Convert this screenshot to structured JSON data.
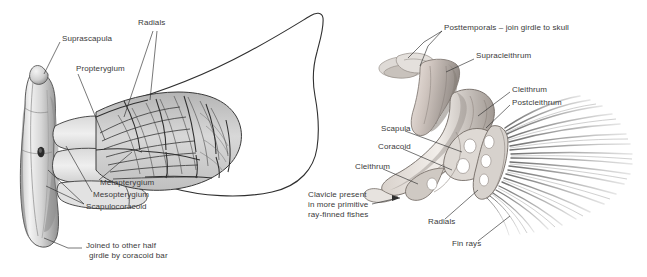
{
  "figure": {
    "background": "#ffffff",
    "ink": "#3a3a3a",
    "label_font_px": 8,
    "panels": [
      {
        "id": "left-panel",
        "name": "shark-pectoral-girdle-and-fin",
        "labels": [
          {
            "key": "suprascapula",
            "text": "Suprascapula",
            "x": 62,
            "y": 38
          },
          {
            "key": "radials_left",
            "text": "Radials",
            "x": 138,
            "y": 22
          },
          {
            "key": "propterygium",
            "text": "Propterygium",
            "x": 76,
            "y": 68
          },
          {
            "key": "metapterygium",
            "text": "Metapterygium",
            "x": 100,
            "y": 182
          },
          {
            "key": "mesopterygium",
            "text": "Mesopterygium",
            "x": 93,
            "y": 194
          },
          {
            "key": "scapulocoracoid",
            "text": "Scapulocoracoid",
            "x": 86,
            "y": 206
          },
          {
            "key": "joined_1",
            "text": "Joined to other half",
            "x": 86,
            "y": 245
          },
          {
            "key": "joined_2",
            "text": "girdle by coracoid bar",
            "x": 86,
            "y": 255
          }
        ]
      },
      {
        "id": "right-panel",
        "name": "bony-fish-pectoral-girdle-and-fin",
        "labels": [
          {
            "key": "posttemporals",
            "text": "Posttemporals – join girdle to skull",
            "x": 444,
            "y": 27
          },
          {
            "key": "supracleithrum",
            "text": "Supracleithrum",
            "x": 476,
            "y": 55
          },
          {
            "key": "cleithrum_top",
            "text": "Cleithrum",
            "x": 512,
            "y": 89
          },
          {
            "key": "postcleithrum",
            "text": "Postcleithrum",
            "x": 512,
            "y": 102
          },
          {
            "key": "scapula",
            "text": "Scapula",
            "x": 381,
            "y": 128
          },
          {
            "key": "coracoid",
            "text": "Coracoid",
            "x": 378,
            "y": 146
          },
          {
            "key": "cleithrum_left",
            "text": "Cleithrum",
            "x": 355,
            "y": 166
          },
          {
            "key": "clavicle_1",
            "text": "Clavicle present",
            "x": 308,
            "y": 194
          },
          {
            "key": "clavicle_2",
            "text": "in more primitive",
            "x": 308,
            "y": 204
          },
          {
            "key": "clavicle_3",
            "text": "ray-finned fishes",
            "x": 308,
            "y": 214
          },
          {
            "key": "radials_right",
            "text": "Radials",
            "x": 428,
            "y": 221
          },
          {
            "key": "fin_rays",
            "text": "Fin rays",
            "x": 452,
            "y": 243
          }
        ]
      }
    ]
  }
}
